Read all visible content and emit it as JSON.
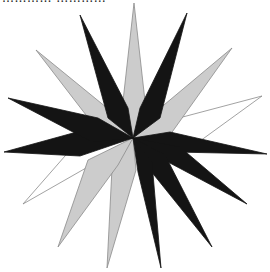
{
  "figure": {
    "center": [
      133,
      138
    ],
    "colors": {
      "black": "#141414",
      "light": "#cccccc",
      "white": "#ffffff",
      "stroke": "#8a8a8a"
    },
    "top_text_cutoff": "………… …………",
    "spokes": [
      {
        "name": "spoke-top",
        "tip": [
          134,
          3
        ],
        "left": [
          122,
          110
        ],
        "right": [
          146,
          110
        ],
        "fill": "light"
      },
      {
        "name": "spoke-top-right",
        "tip": [
          187,
          13
        ],
        "left": [
          140,
          108
        ],
        "right": [
          160,
          118
        ],
        "fill": "black"
      },
      {
        "name": "spoke-upper-right",
        "tip": [
          232,
          48
        ],
        "left": [
          152,
          115
        ],
        "right": [
          170,
          135
        ],
        "fill": "light"
      },
      {
        "name": "spoke-right-upper",
        "tip": [
          262,
          96
        ],
        "left": [
          160,
          123
        ],
        "right": [
          200,
          141
        ],
        "fill": "white"
      },
      {
        "name": "spoke-right",
        "tip": [
          267,
          154
        ],
        "left": [
          170,
          132
        ],
        "right": [
          175,
          152
        ],
        "fill": "black"
      },
      {
        "name": "spoke-right-lower",
        "tip": [
          247,
          204
        ],
        "left": [
          180,
          147
        ],
        "right": [
          168,
          162
        ],
        "fill": "black"
      },
      {
        "name": "spoke-lower-right",
        "tip": [
          212,
          247
        ],
        "left": [
          165,
          155
        ],
        "right": [
          150,
          170
        ],
        "fill": "black"
      },
      {
        "name": "spoke-bottom-right",
        "tip": [
          161,
          268
        ],
        "left": [
          152,
          162
        ],
        "right": [
          138,
          172
        ],
        "fill": "black"
      },
      {
        "name": "spoke-bottom",
        "tip": [
          107,
          268
        ],
        "left": [
          136,
          170
        ],
        "right": [
          112,
          168
        ],
        "fill": "light"
      },
      {
        "name": "spoke-lower-left",
        "tip": [
          58,
          247
        ],
        "left": [
          118,
          165
        ],
        "right": [
          88,
          160
        ],
        "fill": "light"
      },
      {
        "name": "spoke-left-lower",
        "tip": [
          23,
          204
        ],
        "left": [
          100,
          160
        ],
        "right": [
          72,
          148
        ],
        "fill": "white"
      },
      {
        "name": "spoke-left",
        "tip": [
          4,
          152
        ],
        "left": [
          80,
          156
        ],
        "right": [
          84,
          130
        ],
        "fill": "black"
      },
      {
        "name": "spoke-left-upper",
        "tip": [
          8,
          98
        ],
        "left": [
          92,
          142
        ],
        "right": [
          98,
          118
        ],
        "fill": "black"
      },
      {
        "name": "spoke-upper-left",
        "tip": [
          36,
          50
        ],
        "left": [
          96,
          128
        ],
        "right": [
          112,
          112
        ],
        "fill": "light"
      },
      {
        "name": "spoke-top-left",
        "tip": [
          80,
          15
        ],
        "left": [
          108,
          118
        ],
        "right": [
          128,
          108
        ],
        "fill": "black"
      }
    ]
  }
}
